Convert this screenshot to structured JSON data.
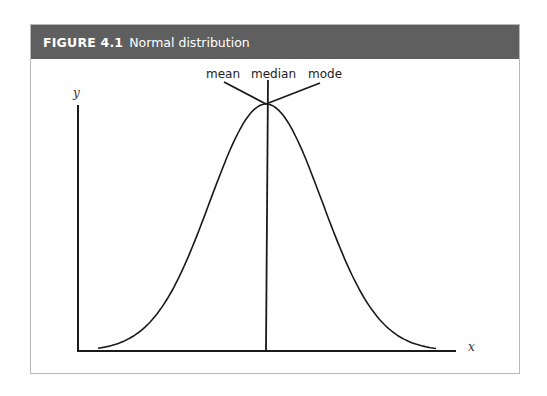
{
  "figure": {
    "number": "FIGURE 4.1",
    "title": "Normal distribution"
  },
  "colors": {
    "header_bg": "#5f5f5f",
    "header_text": "#ffffff",
    "line": "#1a1a1a",
    "frame_border": "#b8b8b8"
  },
  "chart_data": {
    "type": "line",
    "title": "Normal distribution",
    "xlabel": "x",
    "ylabel": "y",
    "curve": "gaussian",
    "center": 0,
    "x_range": [
      -3,
      3
    ],
    "series": [
      {
        "name": "normal density",
        "x": [
          -3,
          -2.5,
          -2,
          -1.5,
          -1,
          -0.5,
          0,
          0.5,
          1,
          1.5,
          2,
          2.5,
          3
        ],
        "y": [
          0.011,
          0.044,
          0.135,
          0.325,
          0.607,
          0.882,
          1.0,
          0.882,
          0.607,
          0.325,
          0.135,
          0.044,
          0.011
        ]
      }
    ],
    "annotations": [
      {
        "text": "mean",
        "points_to": "peak"
      },
      {
        "text": "median",
        "points_to": "peak"
      },
      {
        "text": "mode",
        "points_to": "peak"
      }
    ],
    "grid": false,
    "ticks": false
  },
  "labels": {
    "mean": "mean",
    "median": "median",
    "mode": "mode",
    "x_axis": "x",
    "y_axis": "y"
  }
}
